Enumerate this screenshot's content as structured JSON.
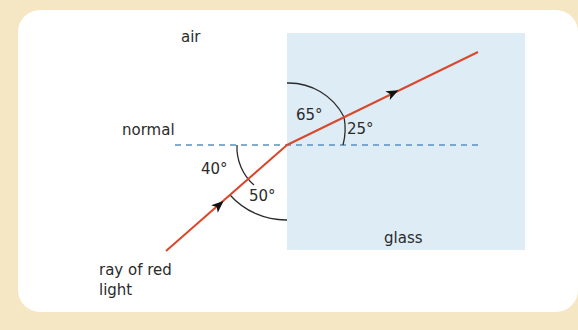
{
  "diagram": {
    "labels": {
      "air": "air",
      "glass": "glass",
      "normal": "normal",
      "ray_line1": "ray of red",
      "ray_line2": "light"
    },
    "angles": {
      "incident_to_normal": "40°",
      "incident_to_surface": "50°",
      "refracted_to_surface": "65°",
      "refracted_to_normal": "25°"
    },
    "colors": {
      "background": "#f6e7c4",
      "panel": "#ffffff",
      "glass": "#deecf6",
      "ray": "#d9482b",
      "normal_line": "#5b8fc0",
      "arc": "#2b2b2b"
    }
  }
}
